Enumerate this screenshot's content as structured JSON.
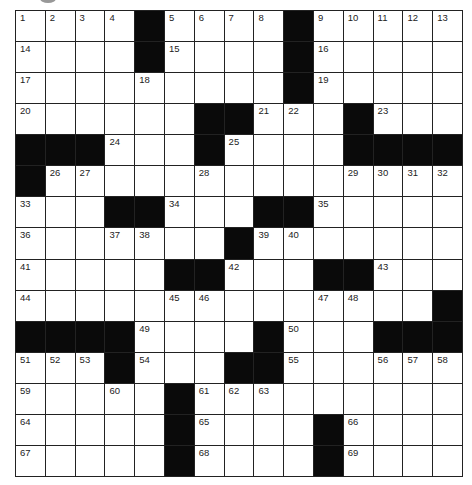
{
  "puzzle": {
    "rows": 15,
    "cols": 15,
    "colors": {
      "black": "#0a0a0a",
      "white": "#ffffff",
      "line": "#222222"
    },
    "grid": [
      [
        "1",
        "2",
        "3",
        "4",
        "#",
        "5",
        "6",
        "7",
        "8",
        "#",
        "9",
        "10",
        "11",
        "12",
        "13"
      ],
      [
        "14",
        "",
        "",
        "",
        "#",
        "15",
        "",
        "",
        "",
        "#",
        "16",
        "",
        "",
        "",
        ""
      ],
      [
        "17",
        "",
        "",
        "",
        "18",
        "",
        "",
        "",
        "",
        "#",
        "19",
        "",
        "",
        "",
        ""
      ],
      [
        "20",
        "",
        "",
        "",
        "",
        "",
        "#",
        "#",
        "21",
        "22",
        "",
        "#",
        "23",
        "",
        ""
      ],
      [
        "#",
        "#",
        "#",
        "24",
        "",
        "",
        "#",
        "25",
        "",
        "",
        "",
        "#",
        "#",
        "#",
        "#"
      ],
      [
        "#",
        "26",
        "27",
        "",
        "",
        "",
        "28",
        "",
        "",
        "",
        "",
        "29",
        "30",
        "31",
        "32"
      ],
      [
        "33",
        "",
        "",
        "#",
        "#",
        "34",
        "",
        "",
        "#",
        "#",
        "35",
        "",
        "",
        "",
        ""
      ],
      [
        "36",
        "",
        "",
        "37",
        "38",
        "",
        "",
        "#",
        "39",
        "40",
        "",
        "",
        "",
        "",
        ""
      ],
      [
        "41",
        "",
        "",
        "",
        "",
        "#",
        "#",
        "42",
        "",
        "",
        "#",
        "#",
        "43",
        "",
        ""
      ],
      [
        "44",
        "",
        "",
        "",
        "",
        "45",
        "46",
        "",
        "",
        "",
        "47",
        "48",
        "",
        "",
        "#"
      ],
      [
        "#",
        "#",
        "#",
        "#",
        "49",
        "",
        "",
        "",
        "#",
        "50",
        "",
        "",
        "#",
        "#",
        "#"
      ],
      [
        "51",
        "52",
        "53",
        "#",
        "54",
        "",
        "",
        "#",
        "#",
        "55",
        "",
        "",
        "56",
        "57",
        "58"
      ],
      [
        "59",
        "",
        "",
        "60",
        "",
        "#",
        "61",
        "62",
        "63",
        "",
        "",
        "",
        "",
        "",
        ""
      ],
      [
        "64",
        "",
        "",
        "",
        "",
        "#",
        "65",
        "",
        "",
        "",
        "#",
        "66",
        "",
        "",
        ""
      ],
      [
        "67",
        "",
        "",
        "",
        "",
        "#",
        "68",
        "",
        "",
        "",
        "#",
        "69",
        "",
        "",
        ""
      ]
    ]
  }
}
